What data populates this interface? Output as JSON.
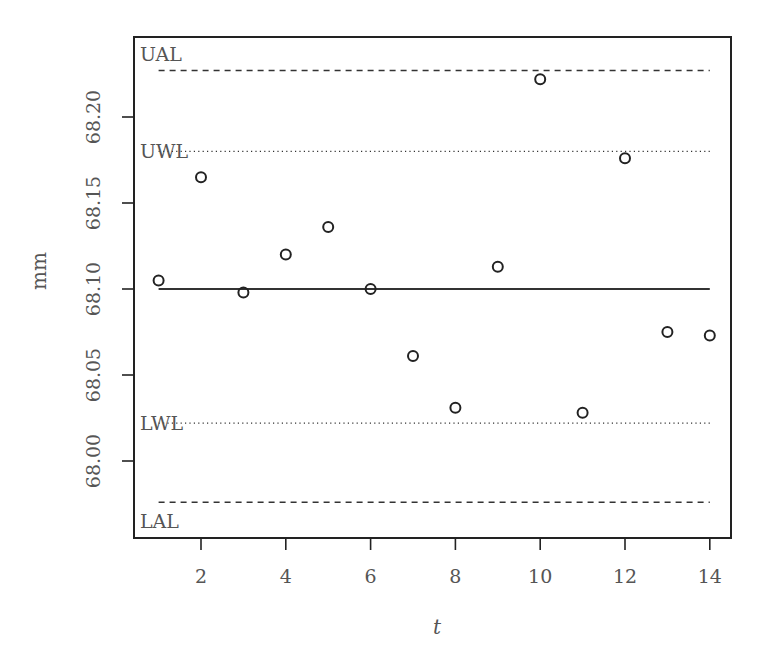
{
  "chart_data": {
    "type": "scatter",
    "title": "",
    "xlabel": "t",
    "ylabel": "mm",
    "xlim": [
      0.5,
      14.5
    ],
    "ylim": [
      67.955,
      68.245
    ],
    "grid": false,
    "legend": null,
    "x_ticks": [
      2,
      4,
      6,
      8,
      10,
      12,
      14
    ],
    "x_tick_labels": [
      "2",
      "4",
      "6",
      "8",
      "10",
      "12",
      "14"
    ],
    "y_ticks": [
      68.0,
      68.05,
      68.1,
      68.15,
      68.2
    ],
    "y_tick_labels": [
      "68.00",
      "68.05",
      "68.10",
      "68.15",
      "68.20"
    ],
    "series": [
      {
        "name": "measurements",
        "marker": "open-circle",
        "x": [
          1,
          2,
          3,
          4,
          5,
          6,
          7,
          8,
          9,
          10,
          11,
          12,
          13,
          14
        ],
        "values": [
          68.105,
          68.165,
          68.098,
          68.12,
          68.136,
          68.1,
          68.061,
          68.031,
          68.113,
          68.222,
          68.028,
          68.176,
          68.075,
          68.073
        ]
      }
    ],
    "reference_lines": [
      {
        "label": "UAL",
        "value": 68.227,
        "style": "dashed"
      },
      {
        "label": "UWL",
        "value": 68.18,
        "style": "dotted"
      },
      {
        "label": "",
        "value": 68.1,
        "style": "solid"
      },
      {
        "label": "LWL",
        "value": 68.022,
        "style": "dotted"
      },
      {
        "label": "LAL",
        "value": 67.976,
        "style": "dashed"
      }
    ],
    "reference_line_x_range": [
      1,
      14
    ]
  },
  "colors": {
    "axis": "#222222",
    "text": "#555555",
    "marker": "#222222",
    "line": "#333333"
  }
}
